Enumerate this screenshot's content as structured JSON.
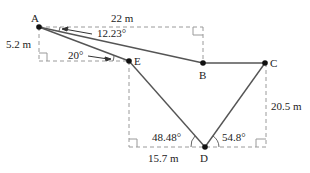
{
  "diagram": {
    "type": "geometry-path",
    "points": {
      "A": {
        "label": "A",
        "x": 39,
        "y": 27
      },
      "E": {
        "label": "E",
        "x": 129,
        "y": 61
      },
      "B": {
        "label": "B",
        "x": 203,
        "y": 63
      },
      "C": {
        "label": "C",
        "x": 265,
        "y": 63
      },
      "D": {
        "label": "D",
        "x": 205,
        "y": 147
      }
    },
    "segments": [
      [
        "A",
        "E"
      ],
      [
        "A",
        "B"
      ],
      [
        "B",
        "C"
      ],
      [
        "E",
        "D"
      ],
      [
        "C",
        "D"
      ]
    ],
    "measurements": {
      "top_width": "22 m",
      "left_height": "5.2 m",
      "right_height": "20.5 m",
      "bottom_left_width": "15.7 m"
    },
    "angles": {
      "angle_AB": "12.23°",
      "angle_AE": "20°",
      "angle_D_left": "48.48°",
      "angle_D_right": "54.8°"
    },
    "colors": {
      "line": "#555555",
      "dashed": "#999999",
      "point": "#111111"
    }
  }
}
